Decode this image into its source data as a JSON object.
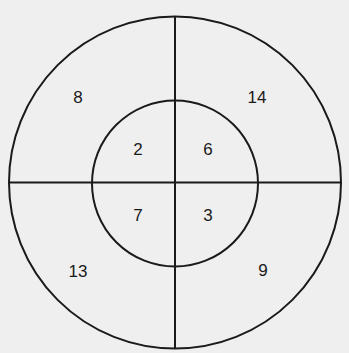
{
  "diagram": {
    "type": "concentric-circle-quadrants",
    "colors": {
      "background": "#efefef",
      "stroke": "#1a1a1a",
      "text": "#1a1a1a"
    },
    "geometry": {
      "center_x": 175,
      "center_y": 182.5,
      "outer_radius": 166,
      "inner_radius": 83
    },
    "regions": {
      "outer": {
        "top_left": "8",
        "top_right": "14",
        "bottom_left": "13",
        "bottom_right": "9"
      },
      "inner": {
        "top_left": "2",
        "top_right": "6",
        "bottom_left": "7",
        "bottom_right": "3"
      }
    }
  }
}
